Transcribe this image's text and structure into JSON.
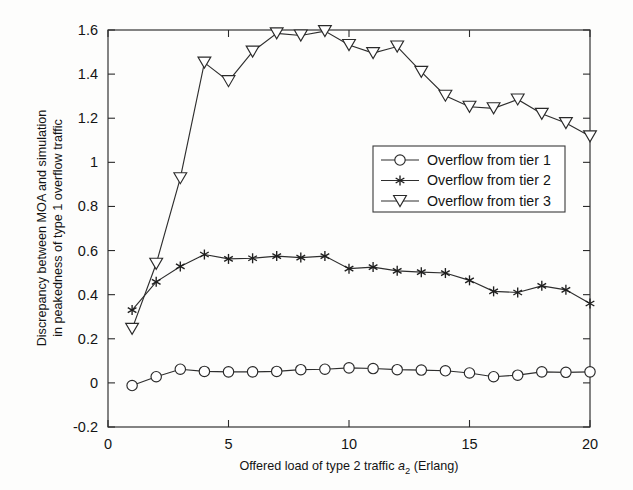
{
  "figure": {
    "background_color": "#fdfdfc",
    "ink_color": "#2b2b2b"
  },
  "chart_data": {
    "type": "line",
    "title": "",
    "xlabel_parts": {
      "pre": "Offered load of type 2 traffic  ",
      "symbol": "a",
      "subscript": "2",
      "post": " (Erlang)"
    },
    "xlabel": "Offered load of type 2 traffic a_2 (Erlang)",
    "ylabel_line1": "Discrepancy between MOA and simulation",
    "ylabel_line2": "in peakedness of type 1 overflow traffic",
    "ylabel": "Discrepancy between MOA and simulation in peakedness of type 1 overflow traffic",
    "xlim": [
      0,
      20
    ],
    "ylim": [
      -0.2,
      1.6
    ],
    "xticks": [
      0,
      5,
      10,
      15,
      20
    ],
    "xticklabels": [
      "0",
      "5",
      "10",
      "15",
      "20"
    ],
    "yticks": [
      -0.2,
      0,
      0.2,
      0.4,
      0.6,
      0.8,
      1.0,
      1.2,
      1.4,
      1.6
    ],
    "yticklabels": [
      "-0.2",
      "0",
      "0.2",
      "0.4",
      "0.6",
      "0.8",
      "1",
      "1.2",
      "1.4",
      "1.6"
    ],
    "grid": false,
    "legend_position": "center-right",
    "x": [
      1,
      2,
      3,
      4,
      5,
      6,
      7,
      8,
      9,
      10,
      11,
      12,
      13,
      14,
      15,
      16,
      17,
      18,
      19,
      20
    ],
    "series": [
      {
        "name": "Overflow from tier 1",
        "marker": "circle",
        "color": "#2a2a2a",
        "values": [
          -0.012,
          0.028,
          0.062,
          0.052,
          0.05,
          0.05,
          0.052,
          0.06,
          0.062,
          0.068,
          0.065,
          0.06,
          0.058,
          0.055,
          0.045,
          0.028,
          0.035,
          0.05,
          0.048,
          0.05
        ]
      },
      {
        "name": "Overflow from tier 2",
        "marker": "star",
        "color": "#1f1f1f",
        "values": [
          0.33,
          0.458,
          0.528,
          0.582,
          0.562,
          0.565,
          0.575,
          0.568,
          0.575,
          0.518,
          0.525,
          0.508,
          0.502,
          0.498,
          0.465,
          0.415,
          0.41,
          0.44,
          0.422,
          0.36
        ]
      },
      {
        "name": "Overflow from tier 3",
        "marker": "triangle-down",
        "color": "#2a2a2a",
        "values": [
          0.245,
          0.54,
          0.928,
          1.452,
          1.368,
          1.502,
          1.585,
          1.575,
          1.595,
          1.532,
          1.495,
          1.525,
          1.41,
          1.302,
          1.252,
          1.245,
          1.285,
          1.22,
          1.178,
          1.118
        ]
      }
    ]
  },
  "legend": {
    "items": [
      {
        "label": "Overflow from tier 1",
        "marker": "circle"
      },
      {
        "label": "Overflow from tier 2",
        "marker": "star"
      },
      {
        "label": "Overflow from tier 3",
        "marker": "triangle-down"
      }
    ]
  }
}
